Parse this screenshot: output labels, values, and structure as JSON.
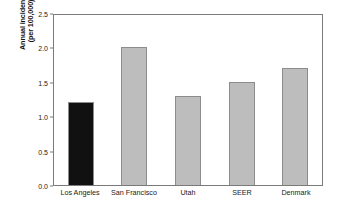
{
  "chart_data": {
    "type": "bar",
    "title": "",
    "xlabel": "",
    "ylabel_line1": "Annual incidence",
    "ylabel_line2": "(per 100,000)",
    "categories": [
      "Los Angeles",
      "San Francisco",
      "Utah",
      "SEER",
      "Denmark"
    ],
    "values": [
      1.2,
      2.0,
      1.3,
      1.5,
      1.7
    ],
    "bar_colors": [
      "#111111",
      "#bdbdbd",
      "#bdbdbd",
      "#bdbdbd",
      "#bdbdbd"
    ],
    "ylim": [
      0.0,
      2.5
    ],
    "ytick_labels": [
      "0.0",
      "0.5",
      "1.0",
      "1.5",
      "2.0",
      "2.5"
    ],
    "ytick_values": [
      0.0,
      0.5,
      1.0,
      1.5,
      2.0,
      2.5
    ],
    "grid": false,
    "legend": "none",
    "frame": "full-box",
    "highlight_color": "#111111",
    "default_bar_color": "#bdbdbd",
    "bar_edge_color": "#8c8c8c",
    "axis_color": "#7a7a7a",
    "background": "#ffffff"
  }
}
